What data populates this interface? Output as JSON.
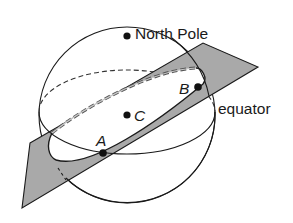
{
  "diagram": {
    "type": "sphere-geometry",
    "labels": {
      "north_pole": "North Pole",
      "equator": "equator",
      "point_a": "A",
      "point_b": "B",
      "point_c": "C"
    },
    "colors": {
      "plane_fill": "#a9a9a9",
      "stroke": "#1a1a1a",
      "background": "#ffffff"
    }
  }
}
